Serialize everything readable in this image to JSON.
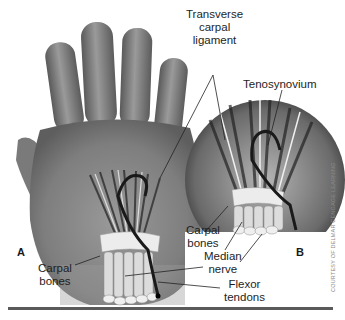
{
  "figure": {
    "panels": [
      {
        "id": "A",
        "label": "A"
      },
      {
        "id": "B",
        "label": "B"
      }
    ],
    "labels": {
      "transverse_carpal_ligament": [
        "Transverse",
        "carpal",
        "ligament"
      ],
      "tenosynovium": "Tenosynovium",
      "carpal_bones_a": [
        "Carpal",
        "bones"
      ],
      "carpal_bones_b": [
        "Carpal",
        "bones"
      ],
      "median_nerve": [
        "Median",
        "nerve"
      ],
      "flexor_tendons": [
        "Flexor",
        "tendons"
      ]
    },
    "credit": "COURTESY OF DELMAR CENGAGE LEARNING",
    "colors": {
      "skin": "#8c8c8c",
      "skin_dark": "#555555",
      "ligament": "#e8e8e8",
      "nerve": "#1a1a1a",
      "rule": "#5a5a5a",
      "background": "#ffffff"
    }
  }
}
